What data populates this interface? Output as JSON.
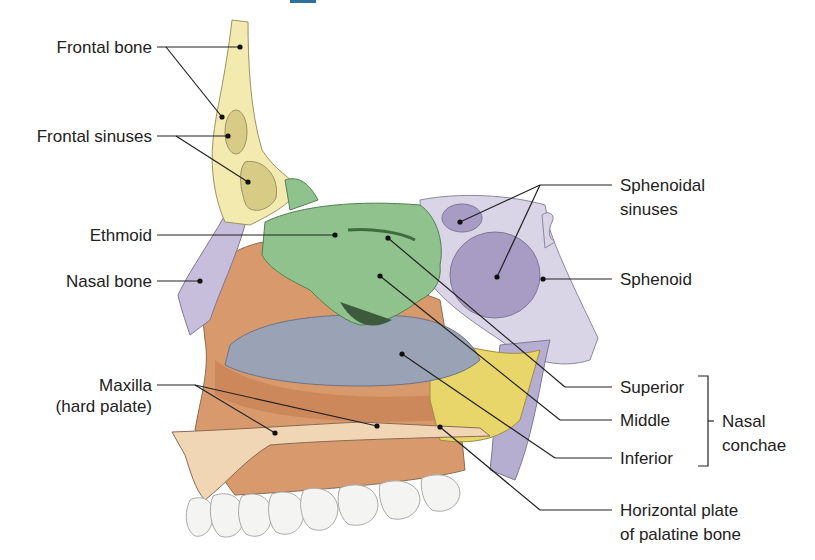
{
  "diagram": {
    "type": "anatomical-illustration",
    "colors": {
      "frontal_bone": "#f3eab0",
      "ethmoid": "#8fc28d",
      "sphenoid": "#d9d4e6",
      "sphenoid_sinus": "#a99cc4",
      "maxilla": "#d89a6c",
      "inferior_concha": "#9aa3b6",
      "palatine": "#e9d66a",
      "nasal_bone": "#c7bedb",
      "teeth": "#f4f4f2",
      "leader_line": "#222222"
    }
  },
  "labels": {
    "left": {
      "frontal_bone": "Frontal bone",
      "frontal_sinuses": "Frontal sinuses",
      "ethmoid": "Ethmoid",
      "nasal_bone": "Nasal bone",
      "maxilla_line1": "Maxilla",
      "maxilla_line2": "(hard palate)"
    },
    "right": {
      "sphenoidal_sinuses_line1": "Sphenoidal",
      "sphenoidal_sinuses_line2": "sinuses",
      "sphenoid": "Sphenoid",
      "superior": "Superior",
      "middle": "Middle",
      "inferior": "Inferior",
      "nasal_conchae_line1": "Nasal",
      "nasal_conchae_line2": "conchae",
      "palatine_line1": "Horizontal plate",
      "palatine_line2": "of palatine bone"
    }
  }
}
